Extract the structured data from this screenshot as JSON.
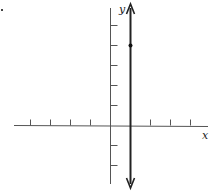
{
  "chart_data": {
    "type": "line",
    "title": "",
    "xlabel": "x",
    "ylabel": "y",
    "xlim": [
      -5,
      4.5
    ],
    "ylim": [
      -3,
      6.2
    ],
    "grid": false,
    "x_ticks": [
      -4,
      -3,
      -2,
      -1,
      2,
      3,
      4
    ],
    "y_ticks": [
      -2,
      -1,
      1,
      2,
      3,
      4,
      5
    ],
    "series": [
      {
        "name": "vertical line x = 1",
        "kind": "vertical-line",
        "x": 1,
        "arrows": "both",
        "color": "#222222"
      }
    ],
    "points": [
      {
        "x": 1,
        "y": 4
      }
    ]
  },
  "labels": {
    "x_axis": "x",
    "y_axis": "y",
    "corner_mark": "."
  }
}
